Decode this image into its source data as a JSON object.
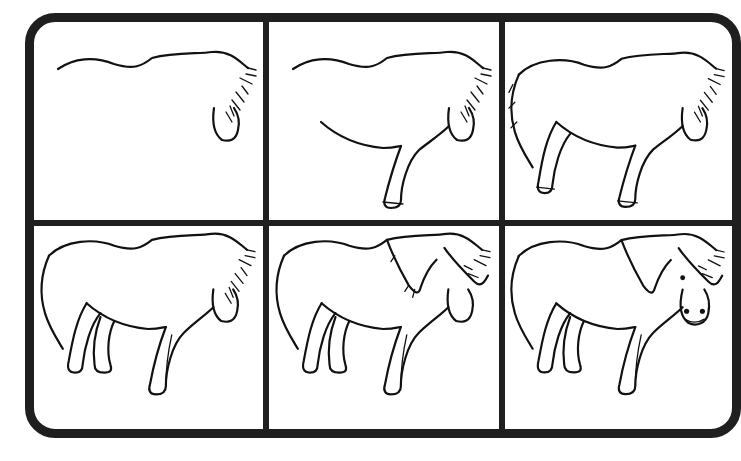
{
  "page": {
    "type": "step-by-step drawing guide",
    "layout": {
      "rows": 2,
      "columns": 3
    },
    "colors": {
      "frame": "#1f1f1f",
      "line_art": "#111111",
      "background": "#ffffff"
    }
  },
  "panels": [
    {
      "step": 1,
      "elements": [
        "back-line",
        "mane-tufts",
        "muzzle-outline"
      ]
    },
    {
      "step": 2,
      "elements": [
        "back-line",
        "mane-tufts",
        "muzzle-outline",
        "belly-line",
        "front-leg"
      ]
    },
    {
      "step": 3,
      "elements": [
        "back-line",
        "mane-tufts",
        "muzzle-outline",
        "belly-line",
        "front-leg",
        "rump-and-tail",
        "hind-leg"
      ]
    },
    {
      "step": 4,
      "elements": [
        "back-line",
        "mane-tufts",
        "muzzle-outline",
        "belly-line",
        "front-leg",
        "rump-and-tail",
        "hind-leg",
        "far-hind-leg",
        "far-front-leg"
      ]
    },
    {
      "step": 5,
      "elements": [
        "back-line",
        "mane-tufts",
        "muzzle-outline",
        "belly-line",
        "front-leg",
        "rump-and-tail",
        "hind-leg",
        "far-hind-leg",
        "far-front-leg",
        "full-mane",
        "forelock"
      ]
    },
    {
      "step": 6,
      "elements": [
        "back-line",
        "mane-tufts",
        "muzzle-outline",
        "belly-line",
        "front-leg",
        "rump-and-tail",
        "hind-leg",
        "far-hind-leg",
        "far-front-leg",
        "full-mane",
        "forelock",
        "eye",
        "nostrils",
        "mouth"
      ]
    }
  ]
}
